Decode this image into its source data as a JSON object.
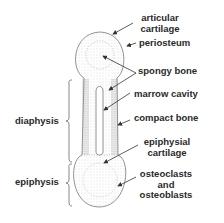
{
  "diagram": {
    "labels": {
      "articular_cartilage": [
        "articular",
        "cartilage"
      ],
      "periosteum": "periosteum",
      "spongy_bone": "spongy bone",
      "marrow_cavity": "marrow cavity",
      "compact_bone": "compact bone",
      "epiphysial_cartilage": [
        "epiphysial",
        "cartilage"
      ],
      "osteoclasts": [
        "osteoclasts",
        "and",
        "osteoblasts"
      ],
      "diaphysis": "diaphysis",
      "epiphysis": "epiphysis"
    },
    "colors": {
      "line": "#444444",
      "text": "#2a2a2a",
      "stipple": "#9a9a9a"
    }
  }
}
